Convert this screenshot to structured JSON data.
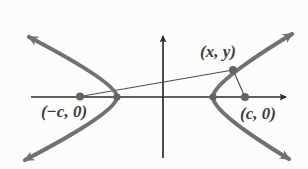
{
  "figure": {
    "colors": {
      "background": "#fcfcfb",
      "curve": "#717171",
      "axis": "#2b2b2b",
      "focal_line": "#4f4f4f",
      "dot": "#636363",
      "label": "#3d3d3d"
    },
    "labels": {
      "left_focus": "(−c, 0)",
      "right_focus": "(c, 0)",
      "point": "(x, y)"
    }
  }
}
